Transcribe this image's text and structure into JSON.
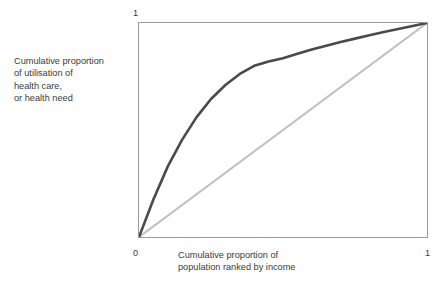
{
  "chart_data": {
    "type": "line",
    "title": "",
    "xlabel": "Cumulative proportion of population ranked by income",
    "ylabel": "Cumulative proportion of utilisation of health care, or health need",
    "xlim": [
      0,
      1
    ],
    "ylim": [
      0,
      1
    ],
    "grid": false,
    "legend": "none",
    "xticks": [
      "0",
      "1"
    ],
    "yticks": [
      "1"
    ],
    "series": [
      {
        "name": "concentration-curve",
        "color": "#4a4a4a",
        "x": [
          0.0,
          0.05,
          0.1,
          0.15,
          0.2,
          0.25,
          0.3,
          0.35,
          0.4,
          0.45,
          0.5,
          0.55,
          0.6,
          0.65,
          0.7,
          0.75,
          0.8,
          0.85,
          0.9,
          0.95,
          1.0
        ],
        "y": [
          0.0,
          0.175,
          0.33,
          0.455,
          0.56,
          0.645,
          0.71,
          0.762,
          0.8,
          0.82,
          0.835,
          0.856,
          0.876,
          0.894,
          0.911,
          0.927,
          0.943,
          0.958,
          0.972,
          0.986,
          1.0
        ]
      },
      {
        "name": "line-of-equality",
        "color": "#c2c2c2",
        "x": [
          0.0,
          1.0
        ],
        "y": [
          0.0,
          1.0
        ]
      }
    ]
  },
  "axes": {
    "y_label_lines": [
      "Cumulative proportion",
      "of utilisation of",
      "health care,",
      "or health need"
    ],
    "x_label_lines": [
      "Cumulative proportion of",
      "population ranked by income"
    ],
    "tick_y_top": "1",
    "tick_x_zero": "0",
    "tick_x_one": "1"
  },
  "style": {
    "curve_color": "#4a4a4a",
    "diagonal_color": "#c2c2c2",
    "frame_color": "#9a9a9a",
    "text_color": "#3a3a3a",
    "background": "#ffffff"
  }
}
